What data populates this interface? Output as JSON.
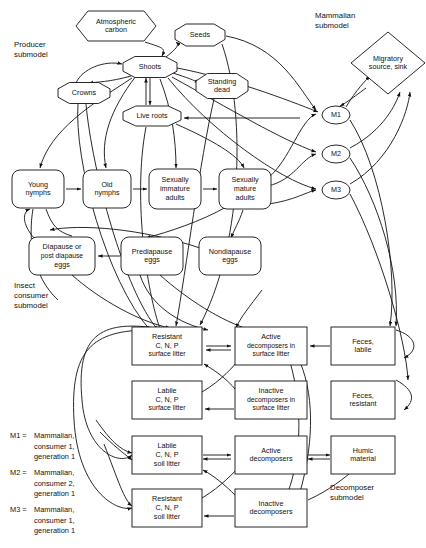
{
  "diagram": {
    "captions": [
      {
        "id": "producer",
        "lines": [
          "Producer",
          "submodel"
        ],
        "x": 14,
        "y": 47
      },
      {
        "id": "mammalian",
        "lines": [
          "Mammalian",
          "submodel"
        ],
        "x": 315,
        "y": 18
      },
      {
        "id": "insect",
        "lines": [
          "Insect",
          "consumer",
          "submodel"
        ],
        "x": 14,
        "y": 288
      },
      {
        "id": "decomposer",
        "lines": [
          "Decomposer",
          "submodel"
        ],
        "x": 330,
        "y": 490
      }
    ],
    "legend": [
      {
        "key": "M1 =",
        "lines": [
          "Mammalian,",
          "consumer 1,",
          "generation 1"
        ]
      },
      {
        "key": "M2 =",
        "lines": [
          "Mammalian,",
          "consumer 2,",
          "generation 1"
        ]
      },
      {
        "key": "M3 =",
        "lines": [
          "Mammalian,",
          "consumer 1,",
          "generation 1"
        ]
      }
    ],
    "nodes": [
      {
        "id": "atmospheric-carbon",
        "shape": "hexagon",
        "lines": [
          "Atmospheric",
          "carbon"
        ],
        "cx": 116,
        "cy": 26,
        "w": 80,
        "h": 30
      },
      {
        "id": "seeds",
        "shape": "octagon",
        "lines": [
          "Seeds"
        ],
        "cx": 200,
        "cy": 35,
        "w": 50,
        "h": 22
      },
      {
        "id": "shoots",
        "shape": "octagon",
        "lines": [
          "Shoots"
        ],
        "cx": 150,
        "cy": 67,
        "w": 54,
        "h": 21
      },
      {
        "id": "standing-dead",
        "shape": "octagon",
        "lines": [
          "Standing",
          "dead"
        ],
        "cx": 222,
        "cy": 86,
        "w": 52,
        "h": 25
      },
      {
        "id": "crowns",
        "shape": "octagon",
        "lines": [
          "Crowns"
        ],
        "cx": 84,
        "cy": 93,
        "w": 52,
        "h": 21
      },
      {
        "id": "live-roots",
        "shape": "octagon",
        "lines": [
          "Live roots"
        ],
        "cx": 152,
        "cy": 116,
        "w": 58,
        "h": 20
      },
      {
        "id": "migratory-source-sink",
        "shape": "diamond",
        "lines": [
          "Migratory",
          "source, sink"
        ],
        "cx": 388,
        "cy": 63,
        "w": 74,
        "h": 62
      },
      {
        "id": "m1",
        "shape": "ellipse",
        "lines": [
          "M1"
        ],
        "cx": 336,
        "cy": 115,
        "w": 28,
        "h": 18
      },
      {
        "id": "m2",
        "shape": "ellipse",
        "lines": [
          "M2"
        ],
        "cx": 336,
        "cy": 154,
        "w": 28,
        "h": 18
      },
      {
        "id": "m3",
        "shape": "ellipse",
        "lines": [
          "M3"
        ],
        "cx": 336,
        "cy": 190,
        "w": 28,
        "h": 18
      },
      {
        "id": "young-nymphs",
        "shape": "roundrect",
        "lines": [
          "Young",
          "nymphs"
        ],
        "cx": 38,
        "cy": 189,
        "w": 52,
        "h": 38
      },
      {
        "id": "old-nymphs",
        "shape": "roundrect",
        "lines": [
          "Old",
          "nymphs"
        ],
        "cx": 107,
        "cy": 189,
        "w": 48,
        "h": 38
      },
      {
        "id": "sexually-immature-adults",
        "shape": "roundrect",
        "lines": [
          "Sexually",
          "immature",
          "adults"
        ],
        "cx": 175,
        "cy": 189,
        "w": 52,
        "h": 40
      },
      {
        "id": "sexually-mature-adults",
        "shape": "roundrect",
        "lines": [
          "Sexually",
          "mature",
          "adults"
        ],
        "cx": 245,
        "cy": 189,
        "w": 52,
        "h": 40
      },
      {
        "id": "diapause-eggs",
        "shape": "roundrect",
        "lines": [
          "Diapause or",
          "post diapause",
          "eggs"
        ],
        "cx": 62,
        "cy": 256,
        "w": 66,
        "h": 38
      },
      {
        "id": "prediapause-eggs",
        "shape": "roundrect",
        "lines": [
          "Prediapause",
          "eggs"
        ],
        "cx": 152,
        "cy": 256,
        "w": 62,
        "h": 38
      },
      {
        "id": "nondiapause-eggs",
        "shape": "roundrect",
        "lines": [
          "Nondiapause",
          "eggs"
        ],
        "cx": 230,
        "cy": 256,
        "w": 62,
        "h": 38
      },
      {
        "id": "resistant-surface-litter",
        "shape": "rect",
        "lines": [
          "Resistant",
          "C, N, P",
          "surface litter"
        ],
        "cx": 167,
        "cy": 346,
        "w": 70,
        "h": 38
      },
      {
        "id": "active-decomposers-surface",
        "shape": "rect",
        "lines": [
          "Active",
          "decomposers in",
          "surface litter"
        ],
        "cx": 271,
        "cy": 346,
        "w": 72,
        "h": 38
      },
      {
        "id": "feces-labile",
        "shape": "rect",
        "lines": [
          "Feces,",
          "labile"
        ],
        "cx": 363,
        "cy": 346,
        "w": 64,
        "h": 38
      },
      {
        "id": "labile-surface-litter",
        "shape": "rect",
        "lines": [
          "Labile",
          "C, N, P",
          "surface litter"
        ],
        "cx": 167,
        "cy": 400,
        "w": 70,
        "h": 38
      },
      {
        "id": "inactive-decomposers-surface",
        "shape": "rect",
        "lines": [
          "Inactive",
          "decomposers in",
          "surface litter"
        ],
        "cx": 271,
        "cy": 400,
        "w": 72,
        "h": 38
      },
      {
        "id": "feces-resistant",
        "shape": "rect",
        "lines": [
          "Feces,",
          "resistant"
        ],
        "cx": 363,
        "cy": 400,
        "w": 64,
        "h": 38
      },
      {
        "id": "labile-soil-litter",
        "shape": "rect",
        "lines": [
          "Labile",
          "C, N, P",
          "soil litter"
        ],
        "cx": 167,
        "cy": 455,
        "w": 70,
        "h": 38
      },
      {
        "id": "active-decomposers",
        "shape": "rect",
        "lines": [
          "Active",
          "decomposers"
        ],
        "cx": 271,
        "cy": 455,
        "w": 72,
        "h": 38
      },
      {
        "id": "humic-material",
        "shape": "rect",
        "lines": [
          "Humic",
          "material"
        ],
        "cx": 363,
        "cy": 455,
        "w": 64,
        "h": 38
      },
      {
        "id": "resistant-soil-litter",
        "shape": "rect",
        "lines": [
          "Resistant",
          "C, N, P",
          "soil litter"
        ],
        "cx": 167,
        "cy": 508,
        "w": 70,
        "h": 38
      },
      {
        "id": "inactive-decomposers",
        "shape": "rect",
        "lines": [
          "Inactive",
          "decomposers"
        ],
        "cx": 271,
        "cy": 508,
        "w": 72,
        "h": 38
      }
    ],
    "edges": [
      {
        "id": "atmospheric-carbon-to-shoots",
        "d": "M 145 42 C 163 48 166 48 162 56",
        "arrow": true
      },
      {
        "id": "shoots-to-seeds",
        "d": "M 166 57 C 176 49 180 45 176 42",
        "arrow": true
      },
      {
        "id": "shoots-to-standing-dead",
        "d": "M 173 73 C 188 78 194 80 199 83",
        "arrow": true
      },
      {
        "id": "crowns-to-shoots",
        "d": "M 76 83 C 82 69 104 60 122 64",
        "arrow": true
      },
      {
        "id": "shoots-to-liveroots-down",
        "d": "M 150 78 L 150 105",
        "arrow": true
      },
      {
        "id": "liveroots-to-shoots-up",
        "d": "M 146 105 L 146 78",
        "arrow": true
      },
      {
        "id": "shoots-to-crowns-down",
        "d": "M 131 76 C 110 82 96 82 89 83",
        "arrow": true
      },
      {
        "id": "standing-dead-to-litter",
        "d": "M 214 99 C 200 160 186 270 176 326",
        "arrow": true
      },
      {
        "id": "seeds-to-m1",
        "d": "M 226 36 C 280 46 300 90 316 110",
        "arrow": true
      },
      {
        "id": "seeds-down-to-litter",
        "d": "M 222 44 C 248 120 240 250 200 325",
        "arrow": true
      },
      {
        "id": "shoots-to-m1",
        "d": "M 177 68 C 230 78 288 100 318 112",
        "arrow": true
      },
      {
        "id": "shoots-to-m2",
        "d": "M 172 77 C 228 108 282 140 316 152",
        "arrow": true
      },
      {
        "id": "shoots-to-m3",
        "d": "M 168 78 C 210 130 280 180 316 189",
        "arrow": true
      },
      {
        "id": "liveroots-from-right",
        "d": "M 300 118 L 184 118",
        "arrow": true
      },
      {
        "id": "crowns-down-to-litter",
        "d": "M 78 104 C 74 160 106 280 150 330",
        "arrow": true
      },
      {
        "id": "crowns-down-to-litter2",
        "d": "M 86 104 C 92 170 124 290 158 330",
        "arrow": true
      },
      {
        "id": "liveroots-down-to-litter",
        "d": "M 146 127 C 132 200 148 300 162 334",
        "arrow": true
      },
      {
        "id": "shoots-down-left-to-nymphs",
        "d": "M 136 76 C 110 110 100 140 106 168",
        "arrow": true
      },
      {
        "id": "shoots-to-young-nymphs",
        "d": "M 132 78 C 92 104 50 130 40 168",
        "arrow": true
      },
      {
        "id": "shoots-to-immature",
        "d": "M 160 79 C 172 110 176 140 176 168",
        "arrow": true
      },
      {
        "id": "liveroots-to-mature",
        "d": "M 176 124 C 212 140 238 155 244 168",
        "arrow": true
      },
      {
        "id": "young-to-old",
        "d": "M 66 189 L 81 189",
        "arrow": true
      },
      {
        "id": "old-to-immature",
        "d": "M 133 189 L 147 189",
        "arrow": true
      },
      {
        "id": "immature-to-mature",
        "d": "M 203 189 L 217 189",
        "arrow": true
      },
      {
        "id": "mature-to-prediapause",
        "d": "M 228 206 C 200 222 168 232 146 238",
        "arrow": true
      },
      {
        "id": "mature-to-nondiapause",
        "d": "M 243 210 C 239 222 234 230 231 238",
        "arrow": true
      },
      {
        "id": "prediapause-to-diapause",
        "d": "M 120 256 L 98 256",
        "arrow": true
      },
      {
        "id": "diapause-to-young",
        "d": "M 34 238 C 22 224 22 212 30 209",
        "arrow": true
      },
      {
        "id": "nondiapause-to-young",
        "d": "M 200 248 C 140 228 80 224 50 230",
        "arrow": true
      },
      {
        "id": "young-down",
        "d": "M 33 209 C 28 238 32 276 58 300",
        "arrow": false
      },
      {
        "id": "young-to-eggs-path",
        "d": "M 46 209 C 52 226 58 232 72 236",
        "arrow": false
      },
      {
        "id": "m1-to-migratory",
        "d": "M 346 107 C 356 90 366 80 370 76",
        "arrow": true
      },
      {
        "id": "migratory-to-m1",
        "d": "M 366 88 C 350 100 344 104 340 106",
        "arrow": true
      },
      {
        "id": "m2-to-migratory",
        "d": "M 350 148 C 384 130 396 104 400 92",
        "arrow": true
      },
      {
        "id": "m3-to-migratory",
        "d": "M 350 184 C 392 160 408 112 410 92",
        "arrow": true
      },
      {
        "id": "m1-to-feces-labile",
        "d": "M 350 120 C 382 170 398 270 390 326",
        "arrow": true
      },
      {
        "id": "m2-to-feces-labile",
        "d": "M 350 158 C 378 200 400 270 396 326",
        "arrow": true
      },
      {
        "id": "m3-to-feces-resistant",
        "d": "M 350 194 C 380 250 406 340 408 380",
        "arrow": true
      },
      {
        "id": "insect-to-m1",
        "d": "M 268 178 C 290 160 300 120 316 114",
        "arrow": true
      },
      {
        "id": "insect-to-m2",
        "d": "M 268 186 C 294 180 302 158 316 154",
        "arrow": true
      },
      {
        "id": "insect-to-m3",
        "d": "M 260 205 C 292 202 306 192 316 190",
        "arrow": true
      },
      {
        "id": "eggs-to-litter",
        "d": "M 160 275 C 188 300 220 320 250 330",
        "arrow": true
      },
      {
        "id": "eggs-down-litter2",
        "d": "M 140 275 C 150 306 180 324 208 330",
        "arrow": true
      },
      {
        "id": "diapause-down",
        "d": "M 72 275 C 100 300 140 322 170 328",
        "arrow": true
      },
      {
        "id": "resistant-surface-to-active",
        "d": "M 206 346 L 231 346",
        "arrow": true
      },
      {
        "id": "active-to-resistant-surface",
        "d": "M 231 350 L 206 350",
        "arrow": true
      },
      {
        "id": "feces-labile-to-active",
        "d": "M 330 346 L 310 346",
        "arrow": true
      },
      {
        "id": "inactive-surface-to-labile",
        "d": "M 234 409 L 205 409",
        "arrow": true
      },
      {
        "id": "labile-to-active-surface",
        "d": "M 202 392 C 222 380 234 366 240 358",
        "arrow": true
      },
      {
        "id": "inactive-to-resistant-surface",
        "d": "M 236 390 C 226 378 214 370 204 364",
        "arrow": true
      },
      {
        "id": "labile-soil-to-active",
        "d": "M 203 455 L 231 455",
        "arrow": true
      },
      {
        "id": "active-to-labile-soil",
        "d": "M 231 459 L 203 459",
        "arrow": true
      },
      {
        "id": "active-to-humic",
        "d": "M 308 455 L 330 455",
        "arrow": true
      },
      {
        "id": "humic-to-active",
        "d": "M 330 459 L 308 459",
        "arrow": true
      },
      {
        "id": "inactive-to-resistant-soil",
        "d": "M 234 516 L 204 516",
        "arrow": true
      },
      {
        "id": "labile-soil-from-inactive",
        "d": "M 236 496 C 224 484 214 476 203 470",
        "arrow": true
      },
      {
        "id": "resistant-soil-to-active",
        "d": "M 202 498 C 222 486 234 472 240 466",
        "arrow": true
      },
      {
        "id": "inactive-to-humic",
        "d": "M 308 500 C 330 490 344 478 354 470",
        "arrow": true
      },
      {
        "id": "feces-resistant-right",
        "d": "M 396 380 C 414 390 416 400 404 410",
        "arrow": true
      },
      {
        "id": "surface-left-loop1",
        "d": "M 156 328 C 100 320 76 336 82 400",
        "arrow": false
      },
      {
        "id": "surface-left-loop2",
        "d": "M 82 400 C 86 452 120 466 132 455",
        "arrow": true
      },
      {
        "id": "surface-left-loop3",
        "d": "M 150 330 C 92 330 70 350 74 420",
        "arrow": false
      },
      {
        "id": "surface-left-loop4",
        "d": "M 74 420 C 78 490 116 512 132 508",
        "arrow": true
      },
      {
        "id": "left-down-to-labile-soil",
        "d": "M 96 420 C 110 440 120 450 132 453",
        "arrow": true
      },
      {
        "id": "left-down-to-labile-soil2",
        "d": "M 100 432 C 114 446 122 452 132 460",
        "arrow": true
      },
      {
        "id": "left-down-to-resistant-soil",
        "d": "M 104 444 C 118 480 124 500 132 506",
        "arrow": true
      },
      {
        "id": "center-down-to-surface",
        "d": "M 262 290 C 250 306 240 318 236 328",
        "arrow": true
      },
      {
        "id": "active-surface-right-loop",
        "d": "M 300 362 C 316 400 312 450 300 492",
        "arrow": false
      },
      {
        "id": "active-surface-right-loop2",
        "d": "M 290 362 C 304 410 300 460 288 492",
        "arrow": false
      },
      {
        "id": "feces-labile-right-edge",
        "d": "M 396 330 C 416 336 420 350 404 358",
        "arrow": true
      }
    ]
  }
}
